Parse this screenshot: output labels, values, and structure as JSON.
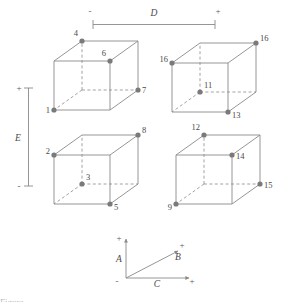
{
  "figure": {
    "line_color": "#8a8a8a",
    "dot_color": "#7a7a7a",
    "text_color": "#4a4a4a",
    "background": "#ffffff"
  },
  "scales": {
    "horizontal": {
      "name": "D",
      "minus_label": "-",
      "plus_label": "+"
    },
    "vertical": {
      "name": "E",
      "plus_label": "+",
      "minus_label": "-"
    }
  },
  "cubes": [
    {
      "id": "cube-top-left",
      "vertex_labels": {
        "back_top_left": "4",
        "front_top_right": "6",
        "front_bottom_right": "7",
        "front_bottom_left": "1"
      }
    },
    {
      "id": "cube-top-right",
      "vertex_labels": {
        "front_top_left": "16",
        "back_top_right": "16",
        "back_bottom_left": "11",
        "front_bottom_right": "13"
      }
    },
    {
      "id": "cube-bottom-left",
      "vertex_labels": {
        "front_top_left": "2",
        "back_top_right": "8",
        "back_bottom_left": "3",
        "front_bottom_right": "5"
      }
    },
    {
      "id": "cube-bottom-right",
      "vertex_labels": {
        "back_top_left": "12",
        "front_top_right": "14",
        "front_bottom_right": "15",
        "front_bottom_left": "9"
      }
    }
  ],
  "axis_triad": {
    "vertical_axis": {
      "name": "A",
      "plus_label": "+"
    },
    "diagonal_axis": {
      "name": "B",
      "plus_label": "+"
    },
    "horizontal_axis": {
      "name": "C",
      "minus_label": "-",
      "plus_label": "+"
    }
  },
  "caption": {
    "text": "Figure"
  }
}
